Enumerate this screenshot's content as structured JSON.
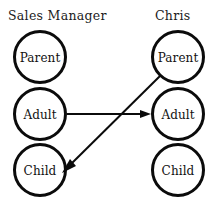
{
  "diagram": {
    "type": "transactional-analysis-crossed-transaction",
    "width": 215,
    "height": 207,
    "background_color": "#ffffff",
    "stroke_color": "#0b0b0b",
    "text_color": "#111111"
  },
  "columns": [
    {
      "id": "left",
      "title": "Sales Manager",
      "title_x": 8,
      "title_y": 20,
      "center_x": 40,
      "states": [
        {
          "id": "left-parent",
          "label": "Parent",
          "cx": 40,
          "cy": 57,
          "r": 25.5
        },
        {
          "id": "left-adult",
          "label": "Adult",
          "cx": 40,
          "cy": 114,
          "r": 25.5
        },
        {
          "id": "left-child",
          "label": "Child",
          "cx": 40,
          "cy": 170,
          "r": 25.5
        }
      ]
    },
    {
      "id": "right",
      "title": "Chris",
      "title_x": 155,
      "title_y": 20,
      "center_x": 178,
      "states": [
        {
          "id": "right-parent",
          "label": "Parent",
          "cx": 178,
          "cy": 57,
          "r": 25.5
        },
        {
          "id": "right-adult",
          "label": "Adult",
          "cx": 178,
          "cy": 114,
          "r": 25.5
        },
        {
          "id": "right-child",
          "label": "Child",
          "cx": 178,
          "cy": 170,
          "r": 25.5
        }
      ]
    }
  ],
  "transactions": [
    {
      "id": "stimulus-adult-to-adult",
      "from": "left-adult",
      "to": "right-adult",
      "direction": "left-to-right",
      "x1": 67,
      "y1": 114,
      "x2": 151,
      "y2": 114,
      "arrow_at": "end"
    },
    {
      "id": "response-parent-to-child",
      "from": "right-parent",
      "to": "left-child",
      "direction": "right-to-left-descending",
      "x1": 160,
      "y1": 76,
      "x2": 62,
      "y2": 173,
      "arrow_at": "end"
    }
  ]
}
